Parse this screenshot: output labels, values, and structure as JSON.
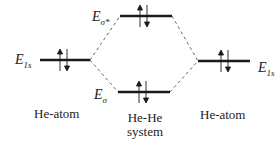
{
  "diagram": {
    "type": "molecular-orbital-energy-diagram",
    "levels": {
      "left_atom": {
        "symbol": "E",
        "subscript": "1s",
        "electrons": "up-down"
      },
      "antibonding": {
        "symbol": "E",
        "subscript": "σ*",
        "electrons": "up-down"
      },
      "bonding": {
        "symbol": "E",
        "subscript": "σ",
        "electrons": "up-down"
      },
      "right_atom": {
        "symbol": "E",
        "subscript": "1s",
        "electrons": "up-down"
      }
    },
    "captions": {
      "left": "He-atom",
      "center_line1": "He-He",
      "center_line2": "system",
      "right": "He-atom"
    },
    "colors": {
      "line": "#1a1a1a",
      "dash": "#555555"
    }
  }
}
